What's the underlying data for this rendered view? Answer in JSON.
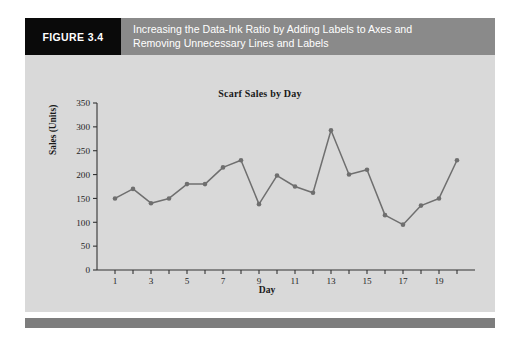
{
  "figure": {
    "badge_label": "FIGURE 3.4",
    "caption_line1": "Increasing the Data-Ink Ratio by Adding Labels to Axes and",
    "caption_line2": "Removing Unnecessary Lines and Labels",
    "badge_bg": "#0a0a0a",
    "band_bg": "#8a8a8a",
    "panel_bg": "#d9d9d9",
    "rule_bg": "#7d7d7d"
  },
  "chart_data": {
    "type": "line",
    "title": "Scarf Sales by Day",
    "xlabel": "Day",
    "ylabel": "Sales (Units)",
    "x": [
      1,
      2,
      3,
      4,
      5,
      6,
      7,
      8,
      9,
      10,
      11,
      12,
      13,
      14,
      15,
      16,
      17,
      18,
      19,
      20
    ],
    "values": [
      150,
      170,
      140,
      150,
      180,
      180,
      215,
      230,
      138,
      198,
      175,
      162,
      293,
      200,
      210,
      115,
      95,
      135,
      150,
      230
    ],
    "series": [
      {
        "name": "Sales (Units)",
        "values": [
          150,
          170,
          140,
          150,
          180,
          180,
          215,
          230,
          138,
          198,
          175,
          162,
          293,
          200,
          210,
          115,
          95,
          135,
          150,
          230
        ]
      }
    ],
    "xlim": [
      0,
      21
    ],
    "ylim": [
      0,
      350
    ],
    "ytick_values": [
      0,
      50,
      100,
      150,
      200,
      250,
      300,
      350
    ],
    "ytick_labels": [
      "0",
      "50",
      "100",
      "150",
      "200",
      "250",
      "300",
      "350"
    ],
    "xtick_values": [
      1,
      2,
      3,
      4,
      5,
      6,
      7,
      8,
      9,
      10,
      11,
      12,
      13,
      14,
      15,
      16,
      17,
      18,
      19,
      20
    ],
    "xtick_labeled": [
      1,
      3,
      5,
      7,
      9,
      11,
      13,
      15,
      17,
      19
    ],
    "xtick_labels": [
      "1",
      "3",
      "5",
      "7",
      "9",
      "11",
      "13",
      "15",
      "17",
      "19"
    ],
    "grid": false,
    "legend": false,
    "marker": "circle",
    "line_color": "#6f6f6f",
    "marker_color": "#6f6f6f",
    "axis_color": "#333333"
  }
}
